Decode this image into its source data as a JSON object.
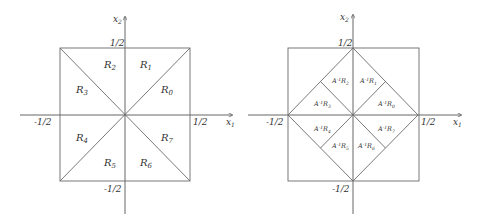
{
  "left_figure": {
    "axis_x_label": "x",
    "axis_x_sub": "1",
    "axis_y_label": "x",
    "axis_y_sub": "2",
    "ticks": {
      "top": "1/2",
      "bottom": "-1/2",
      "left": "-1/2",
      "right": "1/2"
    },
    "regions": [
      {
        "base": "R",
        "sub": "0"
      },
      {
        "base": "R",
        "sub": "1"
      },
      {
        "base": "R",
        "sub": "2"
      },
      {
        "base": "R",
        "sub": "3"
      },
      {
        "base": "R",
        "sub": "4"
      },
      {
        "base": "R",
        "sub": "5"
      },
      {
        "base": "R",
        "sub": "6"
      },
      {
        "base": "R",
        "sub": "7"
      }
    ]
  },
  "right_figure": {
    "axis_x_label": "x",
    "axis_x_sub": "1",
    "axis_y_label": "x",
    "axis_y_sub": "2",
    "ticks": {
      "top": "1/2",
      "bottom": "-1/2",
      "left": "-1/2",
      "right": "1/2"
    },
    "regions": [
      {
        "base": "A",
        "sup": "-1",
        "r": "R",
        "sub": "0"
      },
      {
        "base": "A",
        "sup": "-1",
        "r": "R",
        "sub": "1"
      },
      {
        "base": "A",
        "sup": "-1",
        "r": "R",
        "sub": "2"
      },
      {
        "base": "A",
        "sup": "-1",
        "r": "R",
        "sub": "3"
      },
      {
        "base": "A",
        "sup": "-1",
        "r": "R",
        "sub": "4"
      },
      {
        "base": "A",
        "sup": "-1",
        "r": "R",
        "sub": "5"
      },
      {
        "base": "A",
        "sup": "-1",
        "r": "R",
        "sub": "6"
      },
      {
        "base": "A",
        "sup": "-1",
        "r": "R",
        "sub": "7"
      }
    ]
  }
}
